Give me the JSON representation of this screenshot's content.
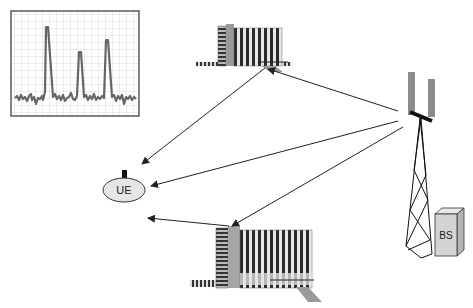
{
  "diagram": {
    "title": "",
    "nodes": {
      "ue": {
        "label": "UE",
        "fill": "#e6e6e6"
      },
      "bs": {
        "label": "BS",
        "fill": "#d4d4d4"
      },
      "antenna": {
        "label": ""
      },
      "building_top": {
        "label": ""
      },
      "building_bottom": {
        "label": ""
      },
      "spectrum_plot": {
        "label": "",
        "peaks": 3
      }
    },
    "edges": [
      {
        "from": "antenna",
        "to": "building_top",
        "type": "arrow"
      },
      {
        "from": "building_top",
        "to": "ue",
        "type": "arrow"
      },
      {
        "from": "antenna",
        "to": "ue",
        "type": "arrow"
      },
      {
        "from": "antenna",
        "to": "building_bottom",
        "type": "arrow"
      },
      {
        "from": "building_bottom",
        "to": "ue",
        "type": "arrow"
      }
    ],
    "colors": {
      "line": "#222222",
      "grid": "#cfcfcf",
      "trace": "#6a6a6a",
      "antenna_panel": "#8c8c8c"
    }
  }
}
